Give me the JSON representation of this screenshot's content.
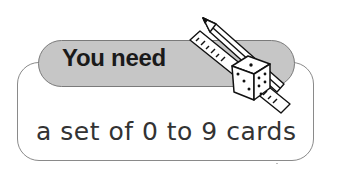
{
  "card": {
    "heading": "You need",
    "content": "a set of 0 to 9 cards",
    "icon": "pencil-ruler-dice-icon"
  },
  "colors": {
    "pill_fill": "#c6c6c6",
    "border": "#8a8a8a",
    "text": "#1a1a1a"
  }
}
